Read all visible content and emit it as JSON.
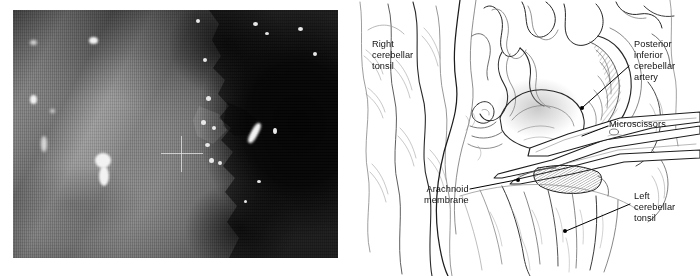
{
  "figure": {
    "panels": [
      {
        "id": "intraoperative-photo",
        "kind": "photograph",
        "description": "Intraoperative operating-microscope view, grayscale, with video scanlines and a central crosshair reticle"
      },
      {
        "id": "line-drawing",
        "kind": "illustration",
        "description": "Pen-and-ink surgical illustration of the cerebellomedullary cistern"
      }
    ]
  },
  "photo": {
    "reticle": "crosshair-reticle"
  },
  "drawing": {
    "labels": [
      {
        "id": "right-cerebellar-tonsil",
        "text": "Right\ncerebellar\ntonsil",
        "leader": false
      },
      {
        "id": "posterior-inferior-cerebellar-artery",
        "text": "Posterior\ninferior\ncerebellar\nartery",
        "leader": true
      },
      {
        "id": "microscissors",
        "text": "Microscissors",
        "leader": true
      },
      {
        "id": "arachnoid-membrane",
        "text": "Arachnoid\nmembrane",
        "leader": true
      },
      {
        "id": "left-cerebellar-tonsil",
        "text": "Left\ncerebellar\ntonsil",
        "leader": true
      }
    ]
  },
  "colors": {
    "background": "#ffffff",
    "ink": "#1a1a1a",
    "label_text": "#111111",
    "leader_line": "#000000",
    "photo_shadow": "#0a0a0a",
    "photo_highlight": "#f2f2f2"
  }
}
